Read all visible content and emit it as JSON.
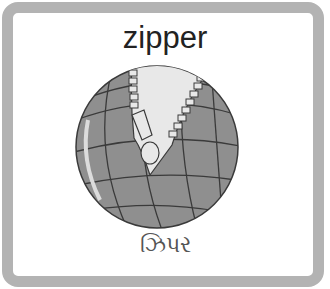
{
  "card": {
    "title": "zipper",
    "subtitle": "ઝિપર",
    "image": "globe-with-zipper-icon"
  },
  "colors": {
    "border": "#b3b3b3",
    "globe": "#8f8f8f",
    "gridlines": "#3a3a3a",
    "zipper_fill": "#e8e8e8"
  }
}
